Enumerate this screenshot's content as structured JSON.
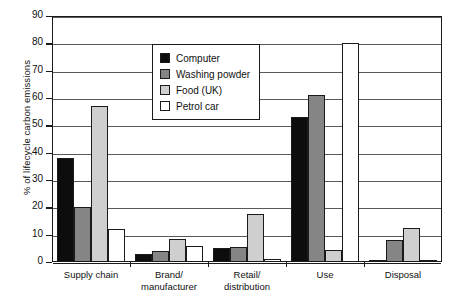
{
  "chart_data": {
    "type": "bar",
    "title": "",
    "xlabel": "",
    "ylabel": "% of lifecycle carbon emissions",
    "ylim": [
      0,
      90
    ],
    "ytick_step": 10,
    "yticks": [
      90,
      80,
      70,
      60,
      50,
      40,
      30,
      20,
      10,
      0
    ],
    "grid": true,
    "legend_position": "upper-center",
    "categories": [
      "Supply chain",
      "Brand/ manufacturer",
      "Retail/ distribution",
      "Use",
      "Disposal"
    ],
    "category_lines": [
      [
        "Supply chain",
        ""
      ],
      [
        "Brand/",
        "manufacturer"
      ],
      [
        "Retail/",
        "distribution"
      ],
      [
        "Use",
        ""
      ],
      [
        "Disposal",
        ""
      ]
    ],
    "series": [
      {
        "name": "Computer",
        "color": "#0d0d0d",
        "values": [
          38,
          3,
          5,
          53,
          0.7
        ]
      },
      {
        "name": "Washing powder",
        "color": "#858585",
        "values": [
          20,
          4,
          5.5,
          61,
          8
        ]
      },
      {
        "name": "Food (UK)",
        "color": "#cfcfcf",
        "values": [
          57,
          8.5,
          17.5,
          4.5,
          12.5
        ]
      },
      {
        "name": "Petrol car",
        "color": "#ffffff",
        "values": [
          12,
          6,
          1,
          80,
          0.5
        ]
      }
    ]
  }
}
